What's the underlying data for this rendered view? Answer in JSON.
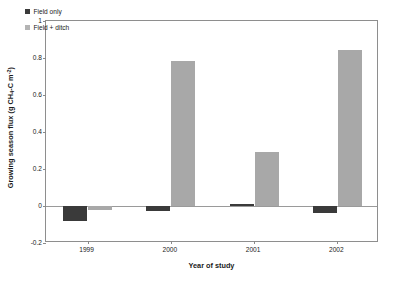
{
  "chart_data": {
    "type": "bar",
    "title": "",
    "subtitle": "",
    "xlabel": "Year of study",
    "ylabel": "Growing season flux (g CH4-C m-2)",
    "ylabel_parts": {
      "lead": "Growing season flux (g CH",
      "sub1": "4",
      "mid": "-C m",
      "sup1": "-2",
      "tail": ")"
    },
    "categories": [
      "1999",
      "2000",
      "2001",
      "2002"
    ],
    "series": [
      {
        "name": "Field only",
        "color": "#3a3a3a",
        "values": [
          -0.08,
          -0.025,
          0.01,
          -0.04
        ]
      },
      {
        "name": "Field + ditch",
        "color": "#a8a8a8",
        "values": [
          -0.02,
          0.785,
          0.29,
          0.845
        ]
      }
    ],
    "ylim": [
      -0.2,
      1
    ],
    "yticks": [
      -0.2,
      0,
      0.2,
      0.4,
      0.6,
      0.8,
      1
    ],
    "ytick_labels": [
      "-0.2",
      "0",
      "0.2",
      "0.4",
      "0.6",
      "0.8",
      "1"
    ],
    "grid": false,
    "legend_position": "top-left",
    "zero_line": true
  },
  "legend": {
    "entries": [
      {
        "label": "Field only",
        "swatch": "legend-swatch-dark"
      },
      {
        "label": "Field + ditch",
        "swatch": "legend-swatch-light"
      }
    ]
  },
  "axes": {
    "x_title": "Year of study",
    "y_title": "Growing season flux (g CH4-C m-2)"
  }
}
